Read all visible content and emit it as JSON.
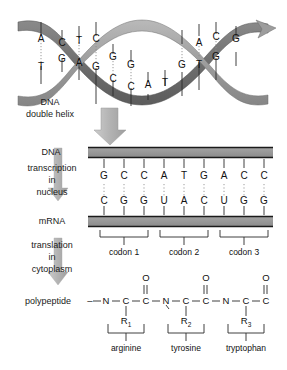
{
  "helix": {
    "label_line1": "DNA",
    "label_line2": "double helix",
    "ribbon_front_color": "#9a9a9a",
    "ribbon_back_color": "#6e6e6e",
    "base_pairs": [
      {
        "top": "A",
        "bottom": "T"
      },
      {
        "top": "C",
        "bottom": "G"
      },
      {
        "top": "T",
        "bottom": "A"
      },
      {
        "top": "C",
        "bottom": "G"
      },
      {
        "top": "G",
        "bottom": "C"
      },
      {
        "top": "G",
        "bottom": "C"
      },
      {
        "top": "A",
        "bottom": "T"
      },
      {
        "top": "T",
        "bottom": "A"
      },
      {
        "top": "G",
        "bottom": "C"
      },
      {
        "top": "A",
        "bottom": "T"
      },
      {
        "top": "C",
        "bottom": "G"
      },
      {
        "top": "G",
        "bottom": "C"
      }
    ]
  },
  "stage_labels": {
    "dna": "DNA",
    "transcription_l1": "transcription",
    "transcription_l2": "in",
    "transcription_l3": "nucleus",
    "mrna": "mRNA",
    "translation_l1": "translation",
    "translation_l2": "in",
    "translation_l3": "cytoplasm",
    "polypeptide": "polypeptide"
  },
  "strands": {
    "dna_template": [
      "G",
      "C",
      "C",
      "A",
      "T",
      "G",
      "A",
      "C",
      "C"
    ],
    "mrna": [
      "C",
      "G",
      "G",
      "U",
      "A",
      "C",
      "U",
      "G",
      "G"
    ],
    "bar_color": "#8c8c8c",
    "bar_edge_color": "#1a1a1a"
  },
  "codons": [
    {
      "label": "codon 1",
      "bases": [
        "C",
        "G",
        "G"
      ]
    },
    {
      "label": "codon 2",
      "bases": [
        "U",
        "A",
        "C"
      ]
    },
    {
      "label": "codon 3",
      "bases": [
        "U",
        "G",
        "G"
      ]
    }
  ],
  "polypeptide": {
    "leading_dash": "–",
    "residues": [
      {
        "backbone": [
          "N",
          "C",
          "C"
        ],
        "carbonyl_oxygen": "O",
        "double_bond": "||",
        "r_group": "R",
        "r_index": "1",
        "amino_acid": "arginine"
      },
      {
        "backbone": [
          "N",
          "C",
          "C"
        ],
        "carbonyl_oxygen": "O",
        "double_bond": "||",
        "r_group": "R",
        "r_index": "2",
        "amino_acid": "tyrosine"
      },
      {
        "backbone": [
          "N",
          "C",
          "C"
        ],
        "carbonyl_oxygen": "O",
        "double_bond": "||",
        "r_group": "R",
        "r_index": "3",
        "amino_acid": "tryptophan"
      }
    ]
  },
  "arrows": {
    "big_arrow_color": "#b4b4b4",
    "flow_arrow_color": "#b0b0b0",
    "names": [
      "helix-to-dna-arrow",
      "transcription-arrow",
      "translation-arrow"
    ]
  }
}
